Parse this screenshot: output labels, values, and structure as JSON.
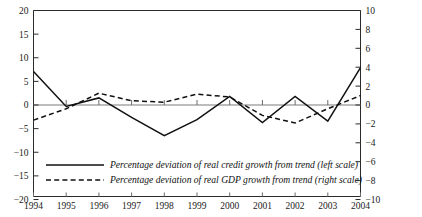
{
  "chart_data": {
    "type": "line",
    "title": "",
    "xlabel": "",
    "ylabel": "",
    "grid": false,
    "legend_position": "inside-bottom-left",
    "x": [
      1994,
      1995,
      1996,
      1997,
      1998,
      1999,
      2000,
      2001,
      2002,
      2003,
      2004
    ],
    "categories": [
      "1994",
      "1995",
      "1996",
      "1997",
      "1998",
      "1999",
      "2000",
      "2001",
      "2002",
      "2003",
      "2004"
    ],
    "left_axis": {
      "label": "",
      "ylim": [
        -20,
        20
      ],
      "ticks": [
        20,
        15,
        10,
        5,
        0,
        -5,
        -10,
        -15,
        -20
      ],
      "tick_labels": [
        "20",
        "15",
        "10",
        "5",
        "0",
        "−5",
        "−10",
        "−15",
        "−20"
      ]
    },
    "right_axis": {
      "label": "",
      "ylim": [
        -10,
        10
      ],
      "ticks": [
        10,
        8,
        6,
        4,
        2,
        0,
        -2,
        -4,
        -6,
        -8,
        -10
      ],
      "tick_labels": [
        "10",
        "8",
        "6",
        "4",
        "2",
        "0",
        "−2",
        "−4",
        "−6",
        "−8",
        "−10"
      ]
    },
    "series": [
      {
        "name": "Percentage deviation of real credit growth from trend (left scale)",
        "axis": "left",
        "style": "solid",
        "values": [
          7.1,
          -0.3,
          1.5,
          -2.6,
          -6.5,
          -3.1,
          1.8,
          -3.7,
          1.8,
          -3.4,
          7.9
        ]
      },
      {
        "name": "Percentage deviation of real GDP growth from trend (right scale)",
        "axis": "right",
        "style": "dashed",
        "values": [
          -1.6,
          -0.4,
          1.25,
          0.45,
          0.3,
          1.15,
          0.85,
          -1.1,
          -1.9,
          -0.4,
          1.0
        ]
      }
    ]
  },
  "legend": {
    "entries": [
      {
        "label": "Percentage deviation of real credit growth from trend (left scale)",
        "style": "solid"
      },
      {
        "label": "Percentage deviation of real GDP growth from trend (right scale)",
        "style": "dashed"
      }
    ]
  }
}
